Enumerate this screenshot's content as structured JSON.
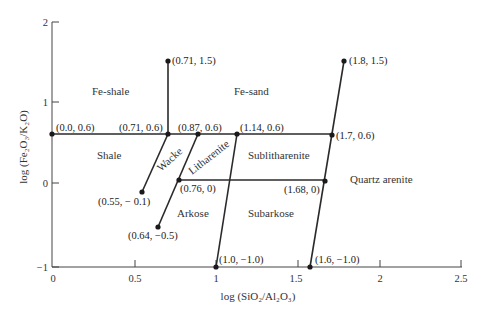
{
  "axes": {
    "x_label": "log (SiO₂/Al₂O₃)",
    "y_label": "log (Fe₂O₃/K₂O)",
    "x_ticks": [
      "0",
      "0.5",
      "1",
      "1.5",
      "2",
      "2.5"
    ],
    "y_ticks": [
      "2",
      "1",
      "0",
      "−1"
    ]
  },
  "regions": {
    "fe_shale": "Fe-shale",
    "fe_sand": "Fe-sand",
    "shale": "Shale",
    "wacke": "Wacke",
    "litharenite": "Litharenite",
    "sublitharenite": "Sublitharenite",
    "quartz_arenite": "Quartz arenite",
    "arkose": "Arkose",
    "subarkose": "Subarkose"
  },
  "points": {
    "p_0_06": "(0.0, 0.6)",
    "p_071_06": "(0.71, 0.6)",
    "p_071_15": "(0.71, 1.5)",
    "p_087_06": "(0.87, 0.6)",
    "p_114_06": "(1.14, 0.6)",
    "p_17_06": "(1.7, 0.6)",
    "p_18_15": "(1.8, 1.5)",
    "p_055_m01": "(0.55, − 0.1)",
    "p_076_0": "(0.76, 0)",
    "p_064_m05": "(0.64, −0.5)",
    "p_168_0": "(1.68, 0)",
    "p_10_m10": "(1.0, −1.0)",
    "p_16_m10": "(1.6, −1.0)"
  },
  "colors": {
    "line": "#2a2a2a",
    "text": "#333333",
    "background": "#ffffff"
  }
}
